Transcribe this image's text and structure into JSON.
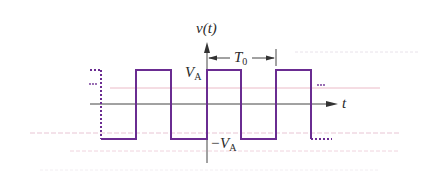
{
  "figure": {
    "type": "periodic square wave",
    "y_axis_label": "v(t)",
    "x_axis_label": "t",
    "high_level_label": "V",
    "high_level_sub": "A",
    "low_level_label": "−V",
    "low_level_sub": "A",
    "period_label": "T",
    "period_sub": "0",
    "continuation_left": "…",
    "continuation_right": "…"
  },
  "colors": {
    "waveform": "#6a2c91",
    "axis": "#444444",
    "text": "#2a2a2a",
    "faint_red": "#e8a0b0",
    "faint_gray": "#d8d0dc",
    "background": "#ffffff"
  },
  "geometry": {
    "axis_origin": [
      207,
      104
    ],
    "high_y": 70,
    "low_y": 139,
    "edges_x": [
      101,
      136,
      171,
      207,
      241,
      276,
      311
    ],
    "period_px": 69
  }
}
